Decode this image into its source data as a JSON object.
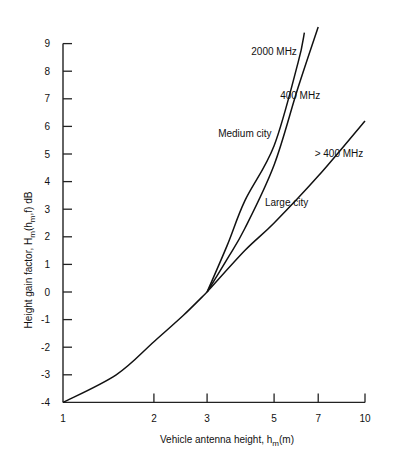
{
  "chart_data": {
    "type": "line",
    "title": "",
    "xlabel": "Vehicle antenna height, h_m(m)",
    "ylabel": "Height gain factor, H_m(h_m, f) dB",
    "x_scale": "log",
    "xlim": [
      1,
      10
    ],
    "ylim": [
      -4,
      9
    ],
    "x_ticks": [
      1,
      2,
      3,
      5,
      7,
      10
    ],
    "y_ticks": [
      -4,
      -3,
      -2,
      -1,
      0,
      1,
      2,
      3,
      4,
      5,
      6,
      7,
      8,
      9
    ],
    "grid": false,
    "series": [
      {
        "name": "Common (all)",
        "x": [
          1,
          1.5,
          2,
          2.5,
          3
        ],
        "y": [
          -4,
          -3.0,
          -1.8,
          -0.85,
          0
        ]
      },
      {
        "name": "2000 MHz (Medium city)",
        "x": [
          3,
          3.5,
          4,
          5,
          6,
          6.3
        ],
        "y": [
          0,
          1.7,
          3.3,
          5.3,
          8.3,
          9.4
        ]
      },
      {
        "name": "400 MHz (Medium city)",
        "x": [
          3,
          3.5,
          4,
          5,
          6,
          7
        ],
        "y": [
          0,
          1.2,
          2.3,
          4.6,
          7.4,
          9.6
        ]
      },
      {
        "name": "> 400 MHz (Large city)",
        "x": [
          3,
          4,
          5,
          7,
          10
        ],
        "y": [
          0,
          1.5,
          2.5,
          4.2,
          6.2
        ]
      }
    ],
    "annotations": [
      {
        "text": "2000 MHz",
        "x": 5.0,
        "y": 8.6
      },
      {
        "text": "400 MHz",
        "x": 6.1,
        "y": 7.0
      },
      {
        "text": "Medium city",
        "x": 4.0,
        "y": 5.6
      },
      {
        "text": "> 400 MHz",
        "x": 8.2,
        "y": 4.9
      },
      {
        "text": "Large city",
        "x": 5.5,
        "y": 3.1
      }
    ]
  },
  "labels": {
    "xlabel_main": "Vehicle antenna height, h",
    "xlabel_sub": "m",
    "xlabel_unit": "(m)",
    "ylabel_main": "Height gain factor, H",
    "ylabel_sub1": "m",
    "ylabel_paren": "(h",
    "ylabel_sub2": "m",
    "ylabel_rest": ",f)  dB"
  }
}
